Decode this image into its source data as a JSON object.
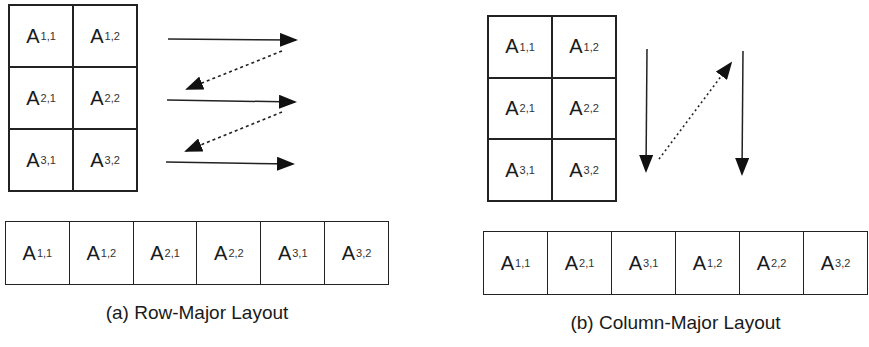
{
  "row_major": {
    "caption": "(a) Row-Major Layout",
    "matrix": [
      [
        {
          "base": "A",
          "sub": "1,1"
        },
        {
          "base": "A",
          "sub": "1,2"
        }
      ],
      [
        {
          "base": "A",
          "sub": "2,1"
        },
        {
          "base": "A",
          "sub": "2,2"
        }
      ],
      [
        {
          "base": "A",
          "sub": "3,1"
        },
        {
          "base": "A",
          "sub": "3,2"
        }
      ]
    ],
    "layout": [
      {
        "base": "A",
        "sub": "1,1"
      },
      {
        "base": "A",
        "sub": "1,2"
      },
      {
        "base": "A",
        "sub": "2,1"
      },
      {
        "base": "A",
        "sub": "2,2"
      },
      {
        "base": "A",
        "sub": "3,1"
      },
      {
        "base": "A",
        "sub": "3,2"
      }
    ],
    "traversal": "horizontal solid arrows per row, dashed return arrows"
  },
  "column_major": {
    "caption": "(b) Column-Major Layout",
    "matrix": [
      [
        {
          "base": "A",
          "sub": "1,1"
        },
        {
          "base": "A",
          "sub": "1,2"
        }
      ],
      [
        {
          "base": "A",
          "sub": "2,1"
        },
        {
          "base": "A",
          "sub": "2,2"
        }
      ],
      [
        {
          "base": "A",
          "sub": "3,1"
        },
        {
          "base": "A",
          "sub": "3,2"
        }
      ]
    ],
    "layout": [
      {
        "base": "A",
        "sub": "1,1"
      },
      {
        "base": "A",
        "sub": "2,1"
      },
      {
        "base": "A",
        "sub": "3,1"
      },
      {
        "base": "A",
        "sub": "1,2"
      },
      {
        "base": "A",
        "sub": "2,2"
      },
      {
        "base": "A",
        "sub": "3,2"
      }
    ],
    "traversal": "vertical solid arrows per column, dotted return arrow"
  }
}
